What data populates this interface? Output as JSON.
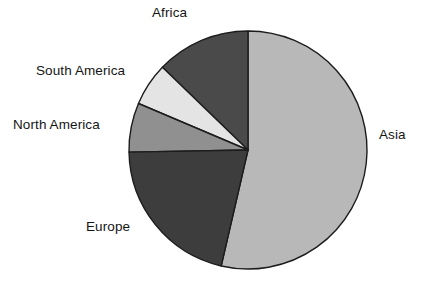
{
  "chart_data": {
    "type": "pie",
    "title": "",
    "subtitle": "",
    "xlabel": "",
    "ylabel": "",
    "legend_position": "none",
    "grid": false,
    "labels_placement": "outside-callout",
    "categories": [
      "Asia",
      "Africa",
      "South America",
      "North America",
      "Europe"
    ],
    "values": [
      53.6,
      12.7,
      5.8,
      6.6,
      21.3
    ],
    "units": "percent",
    "slices": [
      {
        "label": "Asia",
        "value": 53.6,
        "color": "#b8b8b8",
        "start_angle_deg": 257,
        "end_angle_deg": 450,
        "sweep_deg": 193
      },
      {
        "label": "Africa",
        "value": 12.7,
        "color": "#4a4a4a",
        "start_angle_deg": 90,
        "end_angle_deg": 136,
        "sweep_deg": 46
      },
      {
        "label": "South America",
        "value": 5.8,
        "color": "#e4e4e4",
        "start_angle_deg": 136,
        "end_angle_deg": 157,
        "sweep_deg": 21
      },
      {
        "label": "North America",
        "value": 6.6,
        "color": "#909090",
        "start_angle_deg": 157,
        "end_angle_deg": 181,
        "sweep_deg": 24
      },
      {
        "label": "Europe",
        "value": 21.3,
        "color": "#3d3d3d",
        "start_angle_deg": 181,
        "end_angle_deg": 257,
        "sweep_deg": 76
      }
    ],
    "geometry": {
      "center_x": 248,
      "center_y": 150,
      "radius": 119
    },
    "style": {
      "background": "#ffffff",
      "outline_color": "#1c1c1c",
      "label_color": "#151515"
    }
  },
  "labels": {
    "africa": "Africa",
    "south_america": "South America",
    "north_america": "North America",
    "europe": "Europe",
    "asia": "Asia"
  }
}
